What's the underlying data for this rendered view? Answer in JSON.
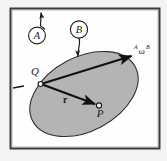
{
  "figure": {
    "background_color": "#f4f3f1",
    "panel_color": "#fefefe",
    "border_color": "#2f2f35",
    "body_fill_color": "#b4b4b4",
    "body_stroke_color": "#303030",
    "vector_color": "#111111",
    "labels": {
      "frame_callout": "A",
      "body_callout": "B",
      "point_q": "Q",
      "point_p": "P",
      "position_vector": "r",
      "angular_velocity_pre": "A",
      "angular_velocity_symbol": "ω",
      "angular_velocity_post": "B",
      "tick_mark": "–"
    },
    "elements": [
      {
        "name": "outer-frame",
        "kind": "rectangle"
      },
      {
        "name": "reference-frame-a",
        "kind": "callout-circle",
        "label": "A"
      },
      {
        "name": "body-b",
        "kind": "callout-circle",
        "label": "B"
      },
      {
        "name": "rigid-body-ellipse",
        "kind": "ellipse"
      },
      {
        "name": "point-q-marker",
        "kind": "open-circle",
        "label": "Q"
      },
      {
        "name": "point-p-marker",
        "kind": "open-circle",
        "label": "P"
      },
      {
        "name": "position-vector-r",
        "kind": "arrow",
        "label": "r",
        "from": "Q",
        "to": "P"
      },
      {
        "name": "angular-velocity-vector",
        "kind": "arrow",
        "label": "AωB",
        "from": "Q"
      }
    ]
  }
}
